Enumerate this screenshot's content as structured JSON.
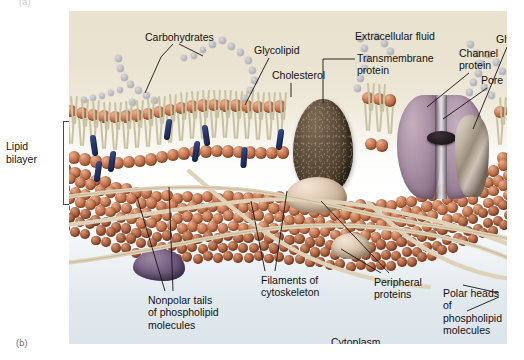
{
  "figure": {
    "part_a_label": "(a)",
    "part_b_label": "(b)"
  },
  "side_label": {
    "lipid_bilayer": "Lipid\nbilayer"
  },
  "labels": {
    "carbohydrates": "Carbohydrates",
    "glycolipid": "Glycolipid",
    "cholesterol": "Cholesterol",
    "extracellular_fluid": "Extracellular fluid",
    "transmembrane_protein": "Transmembrane\nprotein",
    "channel_protein": "Channel\nprotein",
    "pore": "Pore",
    "glycoprotein": "Glycoprotein",
    "nonpolar_tails": "Nonpolar tails\nof phospholipid\nmolecules",
    "filaments_of_cytoskeleton": "Filaments of\ncytoskeleton",
    "peripheral_proteins": "Peripheral\nproteins",
    "polar_heads": "Polar heads\nof phospholipid\nmolecules",
    "cytoplasm": "Cytoplasm"
  },
  "colors": {
    "extracellular_background": "#e9e2cf",
    "cytoplasm_background": "#dde5ea",
    "phospholipid_head": "#b5663f",
    "phospholipid_tail": "#c8c2a2",
    "cholesterol": "#26356b",
    "transmembrane_protein": "#41341f",
    "channel_protein": "#ab92a6",
    "glycoprotein": "#9b8d7d",
    "peripheral_protein": "#dfcab4",
    "carbohydrate_bead": "#b3b3bb",
    "cytoskeleton_filament": "#d8cdb4",
    "label_text": "#121212",
    "leader_line": "#1a1a1a"
  },
  "icons": {
    "carbohydrate_chain": "bead-chain-icon",
    "phospholipid": "phospholipid-icon",
    "cholesterol_molecule": "cholesterol-icon",
    "channel_pore": "pore-icon"
  }
}
